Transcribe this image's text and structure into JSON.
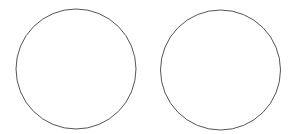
{
  "canvas": {
    "width": 293,
    "height": 134,
    "background": "#ffffff"
  },
  "shapes": [
    {
      "type": "circle",
      "cx": 76,
      "cy": 69,
      "r": 60,
      "stroke": "#555555",
      "fill": "#ffffff"
    },
    {
      "type": "circle",
      "cx": 220.5,
      "cy": 70,
      "r": 60,
      "stroke": "#555555",
      "fill": "#ffffff"
    }
  ]
}
